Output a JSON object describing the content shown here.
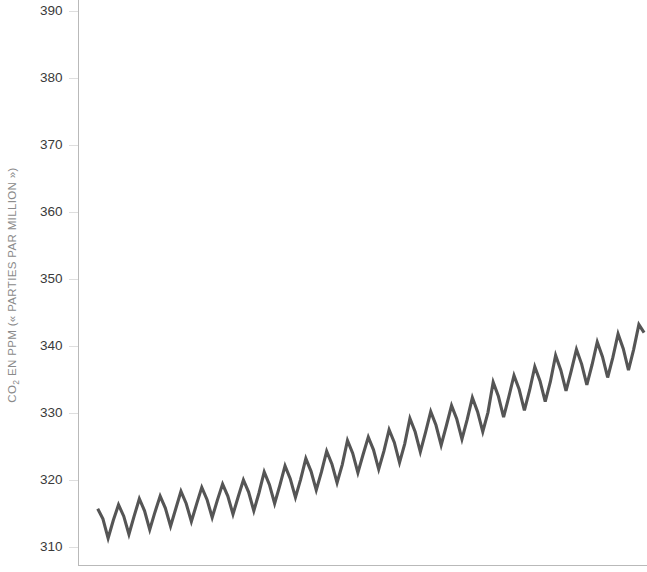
{
  "chart_data": {
    "type": "line",
    "title": "",
    "subtitle": "",
    "xlabel": "",
    "ylabel": "CO2 EN PPM (« PARTIES PAR MILLION »)",
    "ylabel_parts": {
      "prefix": "CO",
      "subscript": "2",
      "suffix": " EN PPM (« PARTIES PAR MILLION »)"
    },
    "ylim": [
      306,
      392
    ],
    "yticks": [
      310,
      320,
      330,
      340,
      350,
      360,
      370,
      380,
      390
    ],
    "ytick_labels": [
      "310",
      "320",
      "330",
      "340",
      "350",
      "360",
      "370",
      "380",
      "390"
    ],
    "xlim": [
      1958.2,
      1984.6
    ],
    "xticks": [],
    "xtick_labels": [],
    "grid": false,
    "legend": null,
    "legend_position": "none",
    "line_color": "#555555",
    "axis_color": "#b9b9b9",
    "tick_label_color": "#3a3a3a",
    "axis_title_color": "#8a8a8a",
    "background_color": "#ffffff",
    "series": [
      {
        "name": "CO2 atmosphérique (Mauna Loa)",
        "color": "#555555",
        "x": [
          1958.21,
          1958.46,
          1958.71,
          1958.96,
          1959.21,
          1959.46,
          1959.71,
          1959.96,
          1960.21,
          1960.46,
          1960.71,
          1960.96,
          1961.21,
          1961.46,
          1961.71,
          1961.96,
          1962.21,
          1962.46,
          1962.71,
          1962.96,
          1963.21,
          1963.46,
          1963.71,
          1963.96,
          1964.21,
          1964.46,
          1964.71,
          1964.96,
          1965.21,
          1965.46,
          1965.71,
          1965.96,
          1966.21,
          1966.46,
          1966.71,
          1966.96,
          1967.21,
          1967.46,
          1967.71,
          1967.96,
          1968.21,
          1968.46,
          1968.71,
          1968.96,
          1969.21,
          1969.46,
          1969.71,
          1969.96,
          1970.21,
          1970.46,
          1970.71,
          1970.96,
          1971.21,
          1971.46,
          1971.71,
          1971.96,
          1972.21,
          1972.46,
          1972.71,
          1972.96,
          1973.21,
          1973.46,
          1973.71,
          1973.96,
          1974.21,
          1974.46,
          1974.71,
          1974.96,
          1975.21,
          1975.46,
          1975.71,
          1975.96,
          1976.21,
          1976.46,
          1976.71,
          1976.96,
          1977.21,
          1977.46,
          1977.71,
          1977.96,
          1978.21,
          1978.46,
          1978.71,
          1978.96,
          1979.21,
          1979.46,
          1979.71,
          1979.96,
          1980.21,
          1980.46,
          1980.71,
          1980.96,
          1981.21,
          1981.46,
          1981.71,
          1981.96,
          1982.21,
          1982.46,
          1982.71,
          1982.96,
          1983.21,
          1983.46,
          1983.71,
          1983.96,
          1984.21,
          1984.46
        ],
        "values": [
          315.7,
          314.2,
          311.3,
          314.0,
          316.3,
          314.6,
          311.9,
          314.6,
          317.2,
          315.4,
          312.6,
          315.2,
          317.6,
          315.8,
          313.1,
          315.7,
          318.3,
          316.5,
          313.8,
          316.4,
          318.9,
          317.1,
          314.4,
          317.0,
          319.4,
          317.6,
          314.9,
          317.5,
          320.0,
          318.2,
          315.4,
          318.1,
          321.2,
          319.3,
          316.5,
          319.2,
          322.1,
          320.2,
          317.4,
          320.1,
          323.2,
          321.3,
          318.5,
          321.2,
          324.3,
          322.4,
          319.6,
          322.3,
          325.9,
          324.0,
          321.1,
          323.8,
          326.4,
          324.5,
          321.6,
          324.3,
          327.5,
          325.6,
          322.6,
          325.4,
          329.2,
          327.2,
          324.2,
          327.1,
          330.2,
          328.2,
          325.2,
          328.1,
          331.1,
          329.1,
          326.1,
          329.0,
          332.3,
          330.2,
          327.2,
          330.1,
          334.6,
          332.5,
          329.4,
          332.4,
          335.6,
          333.5,
          330.4,
          333.4,
          336.9,
          334.8,
          331.7,
          334.7,
          338.6,
          336.4,
          333.3,
          336.3,
          339.5,
          337.3,
          334.2,
          337.2,
          340.6,
          338.4,
          335.3,
          338.3,
          341.8,
          339.6,
          336.4,
          339.5,
          343.2,
          342.0
        ]
      }
    ],
    "annotations": []
  }
}
